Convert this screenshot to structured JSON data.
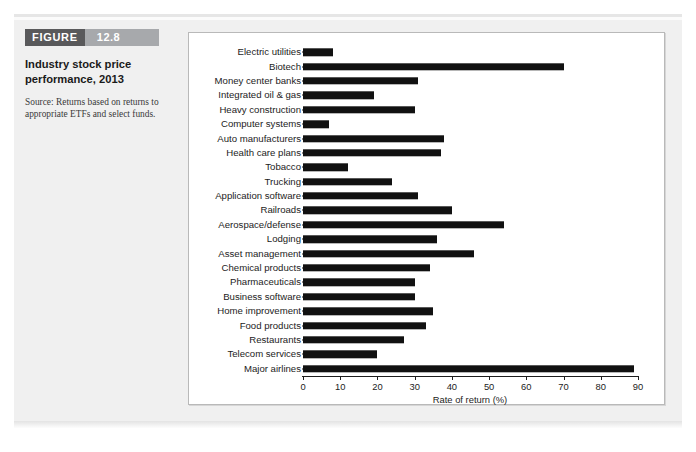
{
  "figure": {
    "tag_word": "FIGURE",
    "tag_number": "12.8",
    "title": "Industry stock price performance, 2013",
    "source": "Source: Returns based on returns to appropriate ETFs and select funds."
  },
  "chart_data": {
    "type": "bar",
    "orientation": "horizontal",
    "title": "Industry stock price performance, 2013",
    "xlabel": "Rate of return (%)",
    "ylabel": "",
    "xlim": [
      0,
      90
    ],
    "xticks": [
      0,
      10,
      20,
      30,
      40,
      50,
      60,
      70,
      80,
      90
    ],
    "grid": false,
    "legend": null,
    "bar_color": "#111111",
    "categories": [
      "Electric utilities",
      "Biotech",
      "Money center banks",
      "Integrated oil & gas",
      "Heavy construction",
      "Computer systems",
      "Auto manufacturers",
      "Health care plans",
      "Tobacco",
      "Trucking",
      "Application software",
      "Railroads",
      "Aerospace/defense",
      "Lodging",
      "Asset management",
      "Chemical products",
      "Pharmaceuticals",
      "Business software",
      "Home improvement",
      "Food products",
      "Restaurants",
      "Telecom services",
      "Major airlines"
    ],
    "values": [
      8,
      70,
      31,
      19,
      30,
      7,
      38,
      37,
      12,
      24,
      31,
      40,
      54,
      36,
      46,
      34,
      30,
      30,
      35,
      33,
      27,
      20,
      89
    ]
  }
}
